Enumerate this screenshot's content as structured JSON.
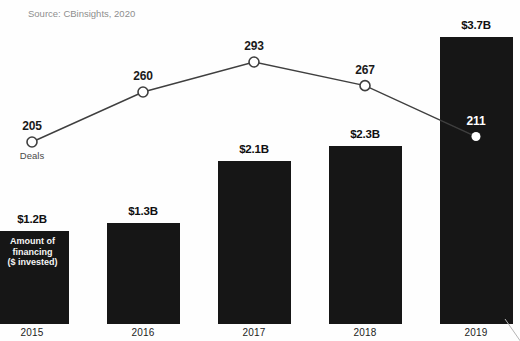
{
  "figure": {
    "title_clipped": "OF THE RETAIL TECH COMPANY DEALS AND FINANCING",
    "source": "Source: CBinsights, 2020"
  },
  "chart_data": {
    "type": "combo-bar-line",
    "categories": [
      "2015",
      "2016",
      "2017",
      "2018",
      "2019"
    ],
    "series": [
      {
        "name": "Amount of financing ($ invested)",
        "type": "bar",
        "unit": "$B",
        "values": [
          1.2,
          1.3,
          2.1,
          2.3,
          3.7
        ],
        "value_labels": [
          "$1.2B",
          "$1.3B",
          "$2.1B",
          "$2.3B",
          "$3.7B"
        ],
        "color": "#161616",
        "label_lines": [
          "Amount of",
          "financing",
          "($ invested)"
        ]
      },
      {
        "name": "Deals",
        "type": "line",
        "values": [
          205,
          260,
          293,
          267,
          211
        ],
        "value_labels": [
          "205",
          "260",
          "293",
          "267",
          "211"
        ],
        "color": "#3f3f3f",
        "marker": "open-circle",
        "label": "Deals"
      }
    ],
    "grid": false,
    "legend_position": "on-chart",
    "x_axis": {
      "tick_labels": [
        "2015",
        "2016",
        "2017",
        "2018",
        "2019"
      ]
    }
  }
}
